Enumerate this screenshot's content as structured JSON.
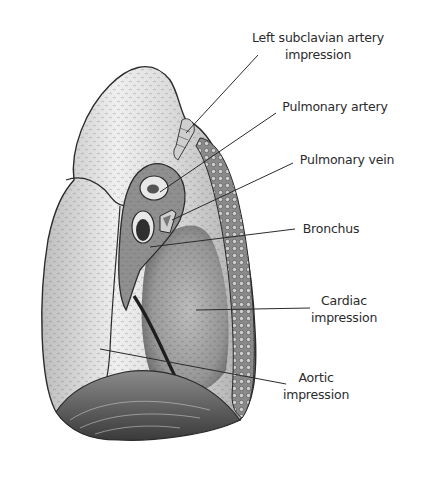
{
  "figure": {
    "colors": {
      "ink": "#2b2b2b",
      "lung_fill": "#e4e4e4",
      "shade": "#9a9a9a",
      "dark": "#3a3a3a",
      "background": "#ffffff"
    }
  },
  "labels": [
    {
      "id": "left-subclavian-artery-impression",
      "lines": [
        "Left subclavian artery",
        "impression"
      ],
      "x": 316,
      "y": 12
    },
    {
      "id": "pulmonary-artery",
      "lines": [
        "Pulmonary artery"
      ],
      "x": 330,
      "y": 99
    },
    {
      "id": "pulmonary-vein",
      "lines": [
        "Pulmonary vein"
      ],
      "x": 342,
      "y": 153
    },
    {
      "id": "bronchus",
      "lines": [
        "Bronchus"
      ],
      "x": 330,
      "y": 221
    },
    {
      "id": "cardiac-impression",
      "lines": [
        "Cardiac",
        "impression"
      ],
      "x": 340,
      "y": 290
    },
    {
      "id": "aortic-impression",
      "lines": [
        "Aortic",
        "impression"
      ],
      "x": 318,
      "y": 368
    }
  ],
  "leader_lines": [
    {
      "label": "left-subclavian-artery-impression",
      "from": [
        258,
        55
      ],
      "to": [
        186,
        133
      ]
    },
    {
      "label": "pulmonary-artery",
      "from": [
        276,
        113
      ],
      "to": [
        168,
        198
      ]
    },
    {
      "label": "pulmonary-vein",
      "from": [
        293,
        163
      ],
      "to": [
        178,
        229
      ]
    },
    {
      "label": "bronchus",
      "from": [
        295,
        229
      ],
      "to": [
        163,
        246
      ]
    },
    {
      "label": "cardiac-impression",
      "from": [
        310,
        308
      ],
      "to": [
        206,
        310
      ]
    },
    {
      "label": "aortic-impression",
      "from": [
        286,
        384
      ],
      "to": [
        100,
        349
      ]
    }
  ]
}
